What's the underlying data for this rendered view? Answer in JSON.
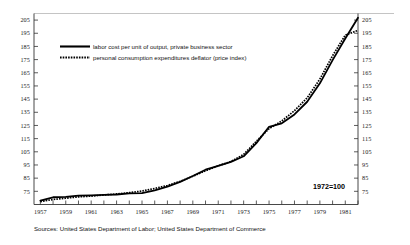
{
  "chart_data": {
    "type": "line",
    "title": "",
    "subtitle": "",
    "xlabel": "",
    "ylabel": "",
    "note": "1972=100",
    "source": "Sources: United States Department of Labor; United States Department of Commerce",
    "grid": false,
    "legend_position": "top-left-inside",
    "xlim": [
      1956.5,
      1982.0
    ],
    "ylim": [
      65,
      210
    ],
    "y_ticks": [
      205,
      195,
      185,
      175,
      165,
      155,
      145,
      135,
      125,
      115,
      105,
      95,
      85,
      75
    ],
    "y_ticks_right": [
      205,
      195,
      185,
      175,
      165,
      155,
      145,
      135,
      125,
      115,
      105,
      95,
      85,
      75
    ],
    "x_ticks": [
      1957,
      1959,
      1961,
      1963,
      1965,
      1967,
      1969,
      1971,
      1973,
      1975,
      1977,
      1979,
      1981
    ],
    "x_minor_step": 1,
    "x": [
      1957,
      1958,
      1959,
      1960,
      1961,
      1962,
      1963,
      1964,
      1965,
      1966,
      1967,
      1968,
      1969,
      1970,
      1971,
      1972,
      1973,
      1974,
      1975,
      1976,
      1977,
      1978,
      1979,
      1980,
      1981,
      1982
    ],
    "series": [
      {
        "name": "labor cost per unit of output, private business sector",
        "style": "solid",
        "values": [
          68.0,
          70.5,
          70.8,
          71.8,
          72.0,
          72.3,
          72.6,
          73.4,
          73.6,
          75.8,
          78.6,
          82.2,
          86.6,
          91.4,
          94.4,
          97.4,
          101.6,
          111.6,
          124.0,
          126.6,
          133.4,
          143.0,
          157.0,
          174.6,
          191.0,
          206.8
        ]
      },
      {
        "name": "personal consumption expenditures deflator (price index)",
        "style": "dotted",
        "values": [
          67.2,
          68.8,
          69.8,
          70.8,
          71.4,
          72.2,
          73.0,
          74.0,
          75.2,
          77.2,
          79.4,
          82.6,
          86.4,
          90.6,
          94.4,
          97.6,
          103.0,
          113.0,
          122.6,
          128.4,
          136.2,
          146.0,
          160.2,
          178.0,
          193.6,
          197.2
        ]
      }
    ]
  },
  "legend": {
    "items": [
      {
        "label": "labor cost per unit of output, private business sector",
        "style": "solid"
      },
      {
        "label": "personal consumption expenditures deflator (price index)",
        "style": "dotted"
      }
    ]
  },
  "annotations": {
    "index_base": "1972=100"
  },
  "footer": {
    "source": "Sources: United States Department of Labor; United States Department of Commerce"
  },
  "colors": {
    "line": "#000000",
    "axis": "#333333",
    "text": "#111111",
    "background": "#ffffff"
  }
}
